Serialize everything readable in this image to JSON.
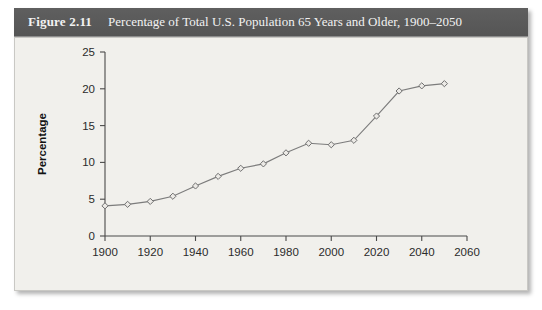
{
  "figure": {
    "label": "Figure 2.11",
    "caption": "Percentage of Total U.S. Population 65 Years and Older, 1900–2050",
    "source_note": ""
  },
  "colors": {
    "title_bar": "#5b5b5b",
    "title_text": "#f2f2f2",
    "panel_background": "#f1f0ec",
    "panel_border": "#c9c8c4",
    "axis": "#4a4a4a",
    "series_line": "#7c7c7c",
    "marker_fill": "#eceae6",
    "marker_stroke": "#6f6f6f"
  },
  "chart_data": {
    "type": "line",
    "title": "Percentage of Total U.S. Population 65 Years and Older, 1900–2050",
    "xlabel": "",
    "ylabel": "Percentage",
    "xlim": [
      1900,
      2060
    ],
    "ylim": [
      0,
      25
    ],
    "xticks": [
      1900,
      1920,
      1940,
      1960,
      1980,
      2000,
      2020,
      2040,
      2060
    ],
    "yticks": [
      0,
      5,
      10,
      15,
      20,
      25
    ],
    "xtick_labels": [
      "1900",
      "1920",
      "1940",
      "1960",
      "1980",
      "2000",
      "2020",
      "2040",
      "2060"
    ],
    "ytick_labels": [
      "0",
      "5",
      "10",
      "15",
      "20",
      "25"
    ],
    "grid": false,
    "legend": false,
    "marker": "diamond",
    "x": [
      1900,
      1910,
      1920,
      1930,
      1940,
      1950,
      1960,
      1970,
      1980,
      1990,
      2000,
      2010,
      2020,
      2030,
      2040,
      2050
    ],
    "values": [
      4.1,
      4.3,
      4.7,
      5.4,
      6.8,
      8.1,
      9.2,
      9.8,
      11.3,
      12.6,
      12.4,
      13.0,
      16.3,
      19.7,
      20.4,
      20.7
    ],
    "series": [
      {
        "name": "Percentage 65 Years and Older",
        "values": [
          4.1,
          4.3,
          4.7,
          5.4,
          6.8,
          8.1,
          9.2,
          9.8,
          11.3,
          12.6,
          12.4,
          13.0,
          16.3,
          19.7,
          20.4,
          20.7
        ]
      }
    ]
  }
}
